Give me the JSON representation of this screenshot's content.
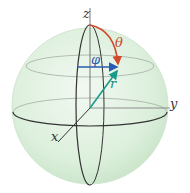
{
  "diagram": {
    "labels": {
      "z_axis": "z",
      "y_axis": "y",
      "x_axis": "x",
      "theta": "θ",
      "phi": "φ",
      "r": "r"
    },
    "colors": {
      "sphere_fill": "#dcefdc",
      "sphere_edge": "#c9e2c9",
      "axis": "#333333",
      "latitude": "#9aa69a",
      "theta_arc": "#d0492a",
      "phi_arrow": "#2a5bb0",
      "r_arrow": "#1a9a8a",
      "theta_label": "#c8472b",
      "phi_label": "#2a5bb0",
      "r_label": "#1a8a7a"
    }
  }
}
